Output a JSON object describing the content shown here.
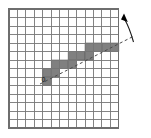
{
  "figure": {
    "labels": {
      "origin": "0"
    },
    "colors": {
      "background": "#ffffff",
      "grid_line": "#777777",
      "grid_border": "#6e6e6e",
      "filled_cell": "#808080",
      "filled_cell_stroke": "#5a5a5a",
      "dashed_line": "#4a4a4a",
      "arrow": "#000000",
      "label_text": "#111111"
    },
    "grid": {
      "columns": 13,
      "rows": 14,
      "x": 9,
      "y": 9,
      "cell_width": 8.45,
      "cell_height": 8.5
    },
    "filled_cells": [
      {
        "col": 4,
        "row": 8
      },
      {
        "col": 4,
        "row": 7
      },
      {
        "col": 5,
        "row": 7
      },
      {
        "col": 5,
        "row": 6
      },
      {
        "col": 6,
        "row": 6
      },
      {
        "col": 7,
        "row": 6
      },
      {
        "col": 7,
        "row": 5
      },
      {
        "col": 8,
        "row": 5
      },
      {
        "col": 9,
        "row": 5
      },
      {
        "col": 9,
        "row": 4
      },
      {
        "col": 10,
        "row": 4
      },
      {
        "col": 11,
        "row": 4
      },
      {
        "col": 12,
        "row": 4
      }
    ],
    "dashed_line": {
      "x1": 40.0,
      "y1": 84.0,
      "x2": 134.0,
      "y2": 36.0,
      "dash_pattern": "3,2.6"
    },
    "arrow": {
      "curve": "M 133.5 42.0 C 131.0 33.0 128.5 26.0 124.5 19.0",
      "head_points": "124.0,13.5 127.8,22.0 121.0,19.6",
      "direction": "up-left"
    },
    "origin_label": {
      "text": "0",
      "x": 41.5,
      "y": 81.5
    }
  }
}
